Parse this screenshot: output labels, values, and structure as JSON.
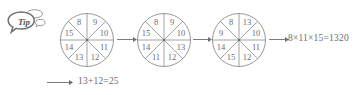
{
  "tip": {
    "label": "Tip",
    "icon": "speech-bubble-icon"
  },
  "colors": {
    "stroke": "#8c8c8c",
    "text": "#6e6e6e",
    "tip_text": "#55555a",
    "background": "#ffffff"
  },
  "diagram": {
    "type": "sequence-of-eight-sector-wheels",
    "wheel_count": 3,
    "sector_count": 8,
    "sector_positions": [
      "upper-left",
      "upper-right",
      "right-upper",
      "right-lower",
      "lower-right",
      "lower-left",
      "left-lower",
      "left-upper"
    ],
    "wheels": [
      {
        "name": "wheel-1",
        "labels": [
          "8",
          "9",
          "10",
          "11",
          "12",
          "13",
          "14",
          "15"
        ]
      },
      {
        "name": "wheel-2",
        "labels": [
          "8",
          "9",
          "10",
          "13",
          "12",
          "11",
          "14",
          "15"
        ]
      },
      {
        "name": "wheel-3",
        "labels": [
          "8",
          "13",
          "10",
          "11",
          "12",
          "15",
          "14",
          "9"
        ]
      }
    ],
    "arrows": [
      {
        "name": "arrow-wheel1-to-wheel2",
        "direction": "right"
      },
      {
        "name": "arrow-wheel2-to-wheel3",
        "direction": "right"
      },
      {
        "name": "arrow-wheel3-to-result",
        "direction": "right"
      },
      {
        "name": "arrow-to-bottom-equation",
        "direction": "right"
      }
    ]
  },
  "equations": {
    "result": "8×11×15=1320",
    "bottom": "13+12=25"
  }
}
